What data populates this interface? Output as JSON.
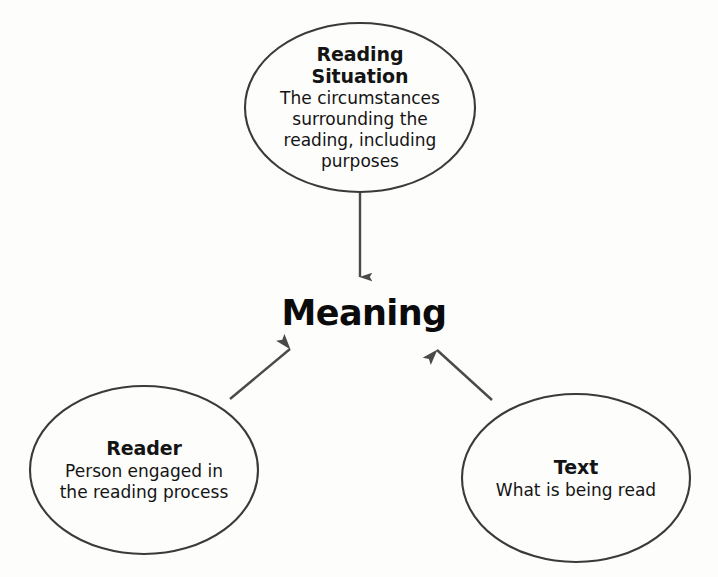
{
  "diagram": {
    "background_color": "#fdfdfc",
    "stroke_color": "#3a3a3a",
    "text_color": "#141414",
    "center": {
      "label": "Meaning",
      "name": "meaning-hub"
    },
    "nodes": [
      {
        "id": "reading-situation",
        "title": "Reading\nSituation",
        "title_line_1": "Reading",
        "title_line_2": "Situation",
        "description": "The circumstances surrounding the reading, including purposes",
        "shape": "ellipse"
      },
      {
        "id": "reader",
        "title": "Reader",
        "description": "Person engaged in the reading process",
        "shape": "ellipse"
      },
      {
        "id": "text",
        "title": "Text",
        "description": "What is being read",
        "shape": "ellipse"
      }
    ],
    "arrows": [
      {
        "id": "arrow-reading-situation-to-meaning",
        "from": "reading-situation",
        "to": "meaning-hub",
        "direction": "down"
      },
      {
        "id": "arrow-reader-to-meaning",
        "from": "reader",
        "to": "meaning-hub",
        "direction": "up-right"
      },
      {
        "id": "arrow-text-to-meaning",
        "from": "text",
        "to": "meaning-hub",
        "direction": "up-left"
      }
    ]
  }
}
